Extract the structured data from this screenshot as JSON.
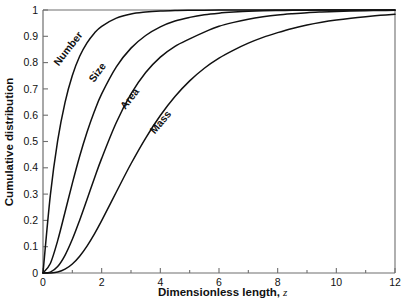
{
  "chart_data": {
    "type": "line",
    "title": "",
    "subtitle": "",
    "xlabel": "Dimensionless length,",
    "xlabel_variable": "z",
    "ylabel": "Cumulative distribution",
    "xlim": [
      0,
      12
    ],
    "ylim": [
      0,
      1
    ],
    "grid": false,
    "legend_position": "inline-curve-labels",
    "xticks": [
      0,
      2,
      4,
      6,
      8,
      10,
      12
    ],
    "xtick_labels": [
      "0",
      "2",
      "4",
      "6",
      "8",
      "10",
      "12"
    ],
    "xminor_ticks": [
      1,
      3,
      5,
      7,
      9,
      11
    ],
    "yticks": [
      0,
      0.1,
      0.2,
      0.3,
      0.4,
      0.5,
      0.6,
      0.7,
      0.8,
      0.9,
      1
    ],
    "ytick_labels": [
      "0",
      "0.1",
      "0.2",
      "0.3",
      "0.4",
      "0.5",
      "0.6",
      "0.7",
      "0.8",
      "0.9",
      "1"
    ],
    "x": [
      0,
      0.25,
      0.5,
      0.75,
      1,
      1.25,
      1.5,
      1.75,
      2,
      2.5,
      3,
      3.5,
      4,
      4.5,
      5,
      5.5,
      6,
      6.5,
      7,
      7.5,
      8,
      8.5,
      9,
      9.5,
      10,
      10.5,
      11,
      11.5,
      12
    ],
    "series": [
      {
        "name": "Number",
        "label": "Number",
        "color": "#111111",
        "values": [
          0,
          0.295,
          0.503,
          0.648,
          0.751,
          0.824,
          0.875,
          0.912,
          0.938,
          0.969,
          0.985,
          0.992,
          0.996,
          0.998,
          0.999,
          0.9995,
          0.9998,
          0.9999,
          1,
          1,
          1,
          1,
          1,
          1,
          1,
          1,
          1,
          1,
          1
        ]
      },
      {
        "name": "Size",
        "label": "Size",
        "color": "#111111",
        "values": [
          0,
          0.036,
          0.123,
          0.231,
          0.341,
          0.444,
          0.535,
          0.614,
          0.681,
          0.784,
          0.855,
          0.903,
          0.936,
          0.958,
          0.972,
          0.982,
          0.988,
          0.992,
          0.995,
          0.997,
          0.998,
          0.9988,
          0.9993,
          0.9996,
          0.9998,
          0.9999,
          1,
          1,
          1
        ]
      },
      {
        "name": "Area",
        "label": "Area",
        "color": "#111111",
        "values": [
          0,
          0.0035,
          0.0244,
          0.0672,
          0.1281,
          0.2009,
          0.2795,
          0.359,
          0.4359,
          0.5724,
          0.6808,
          0.7622,
          0.8209,
          0.862,
          0.8903,
          0.916,
          0.938,
          0.953,
          0.965,
          0.974,
          0.981,
          0.986,
          0.99,
          0.9925,
          0.9945,
          0.996,
          0.9972,
          0.9981,
          0.9988
        ]
      },
      {
        "name": "Mass",
        "label": "Mass",
        "color": "#111111",
        "values": [
          0,
          0.0002,
          0.0036,
          0.0144,
          0.0344,
          0.064,
          0.1025,
          0.148,
          0.1991,
          0.3081,
          0.4154,
          0.5132,
          0.5988,
          0.671,
          0.7305,
          0.7786,
          0.817,
          0.8475,
          0.874,
          0.896,
          0.914,
          0.93,
          0.943,
          0.9535,
          0.962,
          0.969,
          0.9748,
          0.9797,
          0.984
        ]
      }
    ],
    "curve_label_positions": [
      {
        "name": "Number",
        "x": 0.95,
        "y": 0.845,
        "rotate": -52
      },
      {
        "name": "Size",
        "x": 1.95,
        "y": 0.755,
        "rotate": -54
      },
      {
        "name": "Area",
        "x": 3.05,
        "y": 0.655,
        "rotate": -52
      },
      {
        "name": "Mass",
        "x": 4.1,
        "y": 0.565,
        "rotate": -50
      }
    ]
  }
}
